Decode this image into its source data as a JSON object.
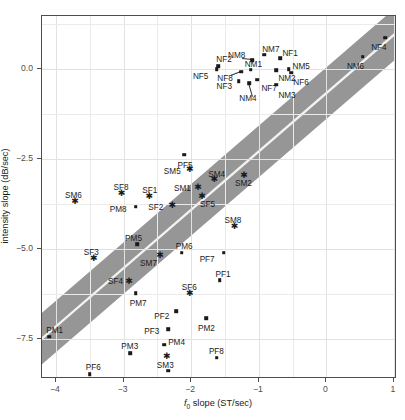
{
  "chart_data": {
    "type": "scatter",
    "title": "",
    "xlabel": "f0 slope (ST/sec)",
    "ylabel": "intensity slope (dB/sec)",
    "xlim": [
      -4.35,
      1.0
    ],
    "ylim": [
      -8.7,
      1.25
    ],
    "xticks": [
      -4,
      -3,
      -2,
      -1,
      0,
      1
    ],
    "xticklabels": [
      "-4",
      "-3",
      "-2",
      "-1",
      "0",
      "1"
    ],
    "yticks": [
      0.0,
      -2.5,
      -5.0,
      -7.5
    ],
    "yticklabels": [
      "0.0",
      "-2.5",
      "-5.0",
      "-7.5"
    ],
    "grid": true,
    "legend": "none",
    "band": {
      "name": "regression-confidence-band",
      "color": "#969696",
      "fit_line_color": "#f2f2f2",
      "slope": 1.62,
      "intercept": -0.72,
      "halfwidth": 0.72
    },
    "marker_styles": {
      "square": "filled square - adult speakers",
      "star": "asterisk - SM/SF speakers"
    },
    "points": [
      {
        "label": "NF4",
        "x": 0.87,
        "y": 0.87,
        "marker": "square",
        "lx": -14,
        "ly": 10
      },
      {
        "label": "NM6",
        "x": 0.54,
        "y": 0.34,
        "marker": "square",
        "lx": -16,
        "ly": 10
      },
      {
        "label": "NM7",
        "x": -0.92,
        "y": 0.4,
        "marker": "square",
        "lx": -2,
        "ly": -5
      },
      {
        "label": "NM8",
        "x": -1.1,
        "y": 0.25,
        "marker": "square",
        "lx": -24,
        "ly": -4,
        "leader": true
      },
      {
        "label": "NF1",
        "x": -0.68,
        "y": 0.3,
        "marker": "square",
        "lx": 2,
        "ly": -4
      },
      {
        "label": "NF2",
        "x": -1.6,
        "y": 0.08,
        "marker": "square",
        "lx": -2,
        "ly": -6
      },
      {
        "label": "NF5",
        "x": -1.62,
        "y": 0.0,
        "marker": "square",
        "lx": -24,
        "ly": 8
      },
      {
        "label": "NM1",
        "x": -1.12,
        "y": -0.02,
        "marker": "square",
        "lx": -6,
        "ly": -5
      },
      {
        "label": "NM5",
        "x": -0.56,
        "y": 0.0,
        "marker": "square",
        "lx": 4,
        "ly": -2
      },
      {
        "label": "NM2",
        "x": -0.74,
        "y": -0.04,
        "marker": "square",
        "lx": 2,
        "ly": 9
      },
      {
        "label": "NF6",
        "x": -0.52,
        "y": -0.1,
        "marker": "square",
        "lx": 2,
        "ly": 10
      },
      {
        "label": "NF8",
        "x": -1.26,
        "y": -0.08,
        "marker": "square",
        "lx": -24,
        "ly": 7,
        "leader": true
      },
      {
        "label": "NF7",
        "x": -1.02,
        "y": -0.3,
        "marker": "square",
        "lx": 4,
        "ly": 9
      },
      {
        "label": "NF3",
        "x": -1.3,
        "y": -0.34,
        "marker": "square",
        "lx": -22,
        "ly": 6
      },
      {
        "label": "NM4",
        "x": -1.14,
        "y": -0.4,
        "marker": "square",
        "lx": -10,
        "ly": 16,
        "leader": true
      },
      {
        "label": "NM3",
        "x": -0.74,
        "y": -0.44,
        "marker": "square",
        "lx": 2,
        "ly": 11
      },
      {
        "label": "PF5",
        "x": -2.1,
        "y": -2.38,
        "marker": "square",
        "lx": -7,
        "ly": 11
      },
      {
        "label": "SM5",
        "x": -2.02,
        "y": -2.78,
        "marker": "star",
        "lx": -26,
        "ly": 3
      },
      {
        "label": "SM4",
        "x": -1.66,
        "y": -3.06,
        "marker": "star",
        "lx": -6,
        "ly": -4
      },
      {
        "label": "SM2",
        "x": -1.22,
        "y": -2.94,
        "marker": "star",
        "lx": -9,
        "ly": 9
      },
      {
        "label": "SM1",
        "x": -1.9,
        "y": -3.28,
        "marker": "star",
        "lx": -24,
        "ly": 2
      },
      {
        "label": "SF8",
        "x": -3.03,
        "y": -3.44,
        "marker": "star",
        "lx": -8,
        "ly": -5
      },
      {
        "label": "SF1",
        "x": -2.62,
        "y": -3.52,
        "marker": "star",
        "lx": -7,
        "ly": -5
      },
      {
        "label": "SF5",
        "x": -1.84,
        "y": -3.52,
        "marker": "star",
        "lx": -2,
        "ly": 9
      },
      {
        "label": "SM6",
        "x": -3.72,
        "y": -3.66,
        "marker": "star",
        "lx": -10,
        "ly": -5
      },
      {
        "label": "SF2",
        "x": -2.28,
        "y": -3.78,
        "marker": "star",
        "lx": -24,
        "ly": 3
      },
      {
        "label": "PM8",
        "x": -2.82,
        "y": -3.82,
        "marker": "square",
        "lx": -26,
        "ly": 3
      },
      {
        "label": "SM8",
        "x": -1.36,
        "y": -4.36,
        "marker": "star",
        "lx": -10,
        "ly": -5
      },
      {
        "label": "PM5",
        "x": -2.8,
        "y": -4.86,
        "marker": "square",
        "lx": -12,
        "ly": -5
      },
      {
        "label": "PM6",
        "x": -2.14,
        "y": -5.1,
        "marker": "square",
        "lx": -6,
        "ly": -6
      },
      {
        "label": "PF7",
        "x": -1.52,
        "y": -5.1,
        "marker": "square",
        "lx": -24,
        "ly": 7
      },
      {
        "label": "SM7",
        "x": -2.46,
        "y": -5.18,
        "marker": "star",
        "lx": -20,
        "ly": 9
      },
      {
        "label": "SF3",
        "x": -3.44,
        "y": -5.26,
        "marker": "star",
        "lx": -10,
        "ly": -5
      },
      {
        "label": "PF1",
        "x": -1.58,
        "y": -5.86,
        "marker": "square",
        "lx": -4,
        "ly": -5
      },
      {
        "label": "SF4",
        "x": -2.92,
        "y": -5.9,
        "marker": "star",
        "lx": -21,
        "ly": 1
      },
      {
        "label": "SF6",
        "x": -2.02,
        "y": -6.22,
        "marker": "star",
        "lx": -8,
        "ly": -5
      },
      {
        "label": "PM7",
        "x": -2.82,
        "y": -6.22,
        "marker": "square",
        "lx": -6,
        "ly": 11
      },
      {
        "label": "PF2",
        "x": -2.22,
        "y": -6.72,
        "marker": "square",
        "lx": -22,
        "ly": 6
      },
      {
        "label": "PM2",
        "x": -1.78,
        "y": -6.92,
        "marker": "square",
        "lx": -8,
        "ly": 11
      },
      {
        "label": "PM1",
        "x": -4.1,
        "y": -7.44,
        "marker": "square",
        "lx": -3,
        "ly": -6
      },
      {
        "label": "PF3",
        "x": -2.34,
        "y": -7.22,
        "marker": "square",
        "lx": -24,
        "ly": 3
      },
      {
        "label": "PM4",
        "x": -2.4,
        "y": -7.66,
        "marker": "square",
        "lx": 4,
        "ly": -2
      },
      {
        "label": "PM3",
        "x": -2.9,
        "y": -7.9,
        "marker": "square",
        "lx": -9,
        "ly": -6
      },
      {
        "label": "PF8",
        "x": -1.62,
        "y": -8.02,
        "marker": "square",
        "lx": -8,
        "ly": -6
      },
      {
        "label": "SM3",
        "x": -2.36,
        "y": -7.98,
        "marker": "star",
        "lx": -10,
        "ly": 10
      },
      {
        "label": "PF4",
        "x": -2.34,
        "y": -8.38,
        "marker": "square",
        "lx": -8,
        "ly": 11
      },
      {
        "label": "PF6",
        "x": -3.5,
        "y": -8.48,
        "marker": "square",
        "lx": -4,
        "ly": -6
      }
    ]
  }
}
